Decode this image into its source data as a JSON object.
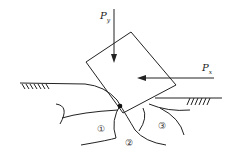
{
  "diagram": {
    "forces": {
      "vertical": {
        "symbol": "P",
        "subscript": "y"
      },
      "horizontal": {
        "symbol": "P",
        "subscript": "x"
      }
    },
    "zones": [
      "①",
      "②",
      "③"
    ],
    "colors": {
      "stroke": "#222222",
      "background": "#ffffff"
    }
  }
}
